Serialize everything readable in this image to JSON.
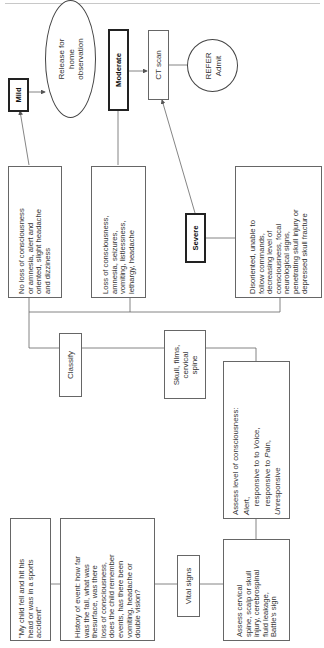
{
  "diagram": {
    "orientation": "rotated-90-ccw",
    "nodes": {
      "mild": {
        "label": "Mild"
      },
      "release": {
        "label": "Release for\nhome\nobservation"
      },
      "moderate": {
        "label": "Moderate"
      },
      "ct_scan": {
        "label": "CT scan"
      },
      "refer": {
        "label": "REFER\nAdmit"
      },
      "mild_criteria": {
        "text": "No loss of consciousness\nor amnesia, alert and\noriented, slight headache\nand dizziness"
      },
      "moderate_criteria": {
        "text": "Loss of consciousness,\namnesia, seizures,\nvomiting, listlessness,\nlethargy, headache"
      },
      "severe": {
        "label": "Severe"
      },
      "severe_criteria": {
        "text": "Disoriented, unable to\nfollow commands,\ndecreasing level of\nconsciousness, focal\nneurological signs,\npenetrating skull injury or\ndepressed skull fracture"
      },
      "classify": {
        "label": "Classify"
      },
      "skull_films": {
        "label": "Skull, films,\ncervical\nspine"
      },
      "assess_loc": {
        "line1": "Assess level of consciousness:",
        "alert_initial": "A",
        "alert_rest": "lert,",
        "voice_prefix": "    responsive to to ",
        "voice_initial": "V",
        "voice_rest": "oice,",
        "pain_prefix": "    responsive to ",
        "pain_initial": "P",
        "pain_rest": "ain,",
        "unresp_initial": "U",
        "unresp_rest": "nresponsive"
      },
      "assess_cervical": {
        "text": "Assess cervical\nspine, scalp or skull\ninjury, cerebrospinal\nfluid leakage,\nBattle's sign"
      },
      "vital_signs": {
        "label": "Vital signs"
      },
      "history": {
        "text": "History of event: how far\nwas the fall, what was\nthesurface, was there\nloss of consciousness,\ndoes the child remember\nevents, has there been\nvomiting, headache or\ndouble vision?"
      },
      "complaint": {
        "text": "\"My child fell and hit his\nhead or was in a sports\naccident\""
      }
    },
    "edges": [
      [
        "complaint",
        "history"
      ],
      [
        "history",
        "vital_signs"
      ],
      [
        "vital_signs",
        "assess_cervical"
      ],
      [
        "assess_cervical",
        "assess_loc"
      ],
      [
        "assess_loc",
        "skull_films"
      ],
      [
        "skull_films",
        "classify"
      ],
      [
        "classify",
        "mild_criteria"
      ],
      [
        "classify",
        "moderate_criteria"
      ],
      [
        "classify",
        "severe_criteria"
      ],
      [
        "mild_criteria",
        "mild"
      ],
      [
        "mild",
        "release"
      ],
      [
        "moderate_criteria",
        "moderate"
      ],
      [
        "moderate",
        "ct_scan"
      ],
      [
        "severe_criteria",
        "severe"
      ],
      [
        "severe",
        "ct_scan"
      ],
      [
        "ct_scan",
        "refer"
      ]
    ]
  }
}
